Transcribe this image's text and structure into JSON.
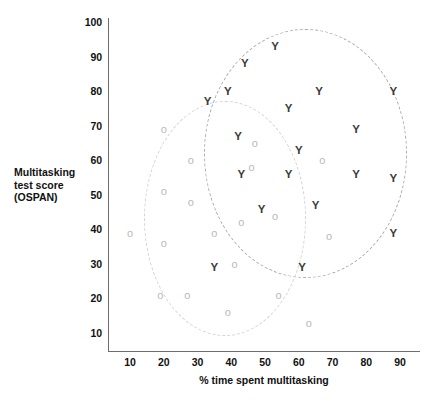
{
  "chart_data": {
    "type": "scatter",
    "title": "",
    "xlabel": "% time spent multitasking",
    "ylabel": "Multitasking test score (OSPAN)",
    "ylabel_lines": [
      "Multitasking",
      "test score",
      "(OSPAN)"
    ],
    "xlim": [
      5,
      95
    ],
    "ylim": [
      5,
      102
    ],
    "xticks": [
      10,
      20,
      30,
      40,
      50,
      60,
      70,
      80,
      90
    ],
    "yticks": [
      10,
      20,
      30,
      40,
      50,
      60,
      70,
      80,
      90,
      100
    ],
    "grid": false,
    "legend": "none",
    "series": [
      {
        "name": "Y",
        "marker": "Y",
        "color": "#3b3b3b",
        "points": [
          {
            "x": 33,
            "y": 77
          },
          {
            "x": 39,
            "y": 80
          },
          {
            "x": 44,
            "y": 88
          },
          {
            "x": 53,
            "y": 93
          },
          {
            "x": 57,
            "y": 75
          },
          {
            "x": 66,
            "y": 80
          },
          {
            "x": 88,
            "y": 80
          },
          {
            "x": 42,
            "y": 67
          },
          {
            "x": 77,
            "y": 69
          },
          {
            "x": 60,
            "y": 63
          },
          {
            "x": 43,
            "y": 56
          },
          {
            "x": 57,
            "y": 56
          },
          {
            "x": 77,
            "y": 56
          },
          {
            "x": 88,
            "y": 55
          },
          {
            "x": 49,
            "y": 46
          },
          {
            "x": 65,
            "y": 47
          },
          {
            "x": 88,
            "y": 39
          },
          {
            "x": 35,
            "y": 29
          },
          {
            "x": 61,
            "y": 29
          }
        ]
      },
      {
        "name": "O",
        "marker": "o",
        "color": "#b9b9b9",
        "points": [
          {
            "x": 20,
            "y": 69
          },
          {
            "x": 28,
            "y": 60
          },
          {
            "x": 47,
            "y": 65
          },
          {
            "x": 46,
            "y": 58
          },
          {
            "x": 67,
            "y": 60
          },
          {
            "x": 20,
            "y": 51
          },
          {
            "x": 28,
            "y": 48
          },
          {
            "x": 53,
            "y": 44
          },
          {
            "x": 43,
            "y": 42
          },
          {
            "x": 35,
            "y": 39
          },
          {
            "x": 10,
            "y": 39
          },
          {
            "x": 20,
            "y": 36
          },
          {
            "x": 69,
            "y": 38
          },
          {
            "x": 41,
            "y": 30
          },
          {
            "x": 19,
            "y": 21
          },
          {
            "x": 27,
            "y": 21
          },
          {
            "x": 54,
            "y": 21
          },
          {
            "x": 39,
            "y": 16
          },
          {
            "x": 63,
            "y": 13
          }
        ]
      }
    ],
    "annotations": [
      {
        "name": "cluster-ellipse-young",
        "shape": "ellipse",
        "style": "dashed",
        "color": "#a9a9a9",
        "center_x": 62,
        "center_y": 62,
        "rx": 30,
        "ry": 36,
        "rotation_deg": 0
      },
      {
        "name": "cluster-ellipse-old",
        "shape": "ellipse",
        "style": "dashed",
        "color": "#d2d2d2",
        "center_x": 38,
        "center_y": 43,
        "rx": 24,
        "ry": 34,
        "rotation_deg": 0
      }
    ]
  }
}
